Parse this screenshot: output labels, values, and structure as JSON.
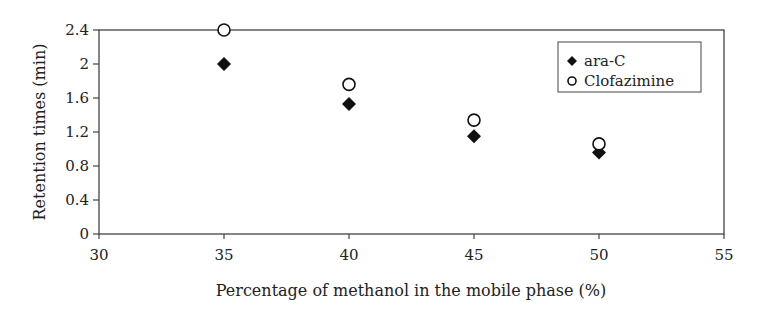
{
  "chart_data": {
    "type": "scatter",
    "title": "",
    "xlabel": "Percentage of methanol in the mobile phase (%)",
    "ylabel": "Retention times (min)",
    "xlim": [
      30,
      55
    ],
    "ylim": [
      0,
      2.4
    ],
    "xticks": [
      30,
      35,
      40,
      45,
      50,
      55
    ],
    "yticks": [
      0,
      0.4,
      0.8,
      1.2,
      1.6,
      2,
      2.4
    ],
    "ytick_labels": [
      "0",
      "0.4",
      "0.8",
      "1.2",
      "1.6",
      "2",
      "2.4"
    ],
    "grid": false,
    "legend_position": "upper right (inside)",
    "series": [
      {
        "name": "ara-C",
        "marker": "filled-diamond",
        "color": "#111111",
        "x": [
          35,
          40,
          45,
          50
        ],
        "y": [
          2.0,
          1.53,
          1.15,
          0.96
        ]
      },
      {
        "name": "Clofazimine",
        "marker": "open-circle",
        "color": "#111111",
        "x": [
          35,
          40,
          45,
          50
        ],
        "y": [
          2.4,
          1.76,
          1.34,
          1.06
        ]
      }
    ]
  }
}
